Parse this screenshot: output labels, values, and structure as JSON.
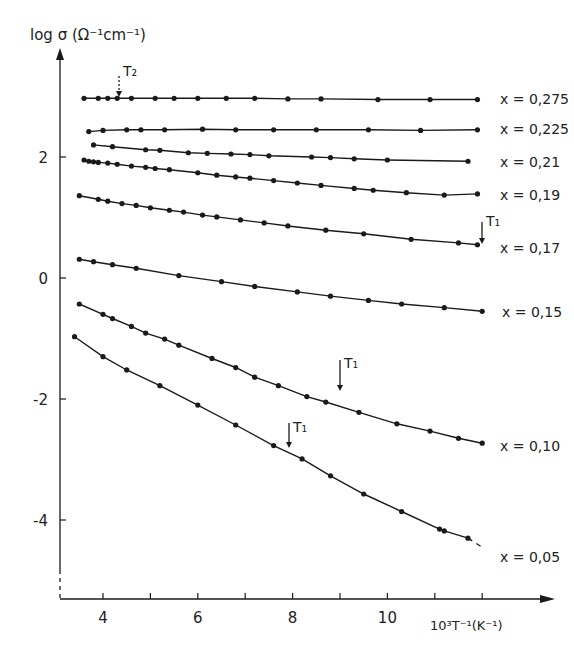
{
  "chart_data": {
    "type": "line",
    "title": "",
    "ylabel": "log σ (Ω⁻¹cm⁻¹)",
    "xlabel": "10³T⁻¹ (K⁻¹)",
    "xlim": [
      3.2,
      13.0
    ],
    "ylim": [
      -5.3,
      3.7
    ],
    "xticks": [
      4,
      5,
      6,
      7,
      8,
      9,
      10,
      11,
      12
    ],
    "xtick_labels": [
      "4",
      "",
      "6",
      "",
      "8",
      "",
      "10",
      "",
      ""
    ],
    "yticks": [
      2,
      0,
      -2,
      -4
    ],
    "ytick_labels": [
      "2",
      "0",
      "-2",
      "-4"
    ],
    "grid": false,
    "legend": "inline labels at right end of each curve",
    "series": [
      {
        "name": "x = 0,275",
        "x": [
          3.6,
          3.9,
          4.1,
          4.3,
          4.6,
          5.1,
          5.5,
          6.0,
          6.6,
          7.2,
          7.9,
          8.6,
          9.8,
          10.9,
          11.9
        ],
        "y": [
          2.97,
          2.97,
          2.97,
          2.97,
          2.97,
          2.97,
          2.97,
          2.97,
          2.97,
          2.97,
          2.96,
          2.96,
          2.95,
          2.95,
          2.95
        ]
      },
      {
        "name": "x = 0,225",
        "x": [
          3.7,
          4.0,
          4.5,
          4.8,
          5.3,
          6.1,
          6.8,
          7.6,
          8.5,
          9.6,
          10.7,
          11.9
        ],
        "y": [
          2.42,
          2.44,
          2.45,
          2.45,
          2.45,
          2.46,
          2.45,
          2.45,
          2.45,
          2.45,
          2.44,
          2.45
        ]
      },
      {
        "name": "x = 0,21",
        "x": [
          3.8,
          4.2,
          4.9,
          5.2,
          5.8,
          6.2,
          6.7,
          7.1,
          7.5,
          8.4,
          8.8,
          9.3,
          10.0,
          11.7
        ],
        "y": [
          2.2,
          2.17,
          2.12,
          2.11,
          2.07,
          2.06,
          2.05,
          2.04,
          2.02,
          2.0,
          1.99,
          1.97,
          1.95,
          1.93
        ]
      },
      {
        "name": "x = 0,19",
        "x": [
          3.6,
          3.7,
          3.8,
          3.9,
          4.1,
          4.3,
          4.6,
          4.9,
          5.1,
          5.4,
          6.0,
          6.4,
          6.8,
          7.1,
          7.6,
          8.1,
          8.6,
          9.3,
          9.7,
          10.4,
          11.2,
          11.9
        ],
        "y": [
          1.95,
          1.93,
          1.92,
          1.91,
          1.9,
          1.88,
          1.85,
          1.83,
          1.81,
          1.79,
          1.74,
          1.7,
          1.67,
          1.65,
          1.61,
          1.57,
          1.53,
          1.48,
          1.45,
          1.41,
          1.37,
          1.39
        ]
      },
      {
        "name": "x = 0,17",
        "x": [
          3.5,
          3.9,
          4.1,
          4.4,
          4.7,
          5.0,
          5.4,
          5.7,
          6.1,
          6.4,
          6.9,
          7.4,
          7.9,
          8.7,
          9.5,
          10.5,
          11.5,
          11.9
        ],
        "y": [
          1.36,
          1.3,
          1.27,
          1.23,
          1.2,
          1.16,
          1.12,
          1.09,
          1.04,
          1.01,
          0.96,
          0.91,
          0.86,
          0.79,
          0.73,
          0.64,
          0.58,
          0.55
        ]
      },
      {
        "name": "x = 0,15",
        "x": [
          3.5,
          3.8,
          4.2,
          4.7,
          5.6,
          6.5,
          7.2,
          8.1,
          8.8,
          9.6,
          10.3,
          11.2,
          12.0
        ],
        "y": [
          0.31,
          0.27,
          0.22,
          0.16,
          0.04,
          -0.06,
          -0.14,
          -0.23,
          -0.3,
          -0.37,
          -0.43,
          -0.49,
          -0.55
        ]
      },
      {
        "name": "x = 0,10",
        "x": [
          3.5,
          4.0,
          4.2,
          4.6,
          4.9,
          5.3,
          5.6,
          6.3,
          6.8,
          7.2,
          7.7,
          8.3,
          8.7,
          9.4,
          10.2,
          10.9,
          11.5,
          12.0
        ],
        "y": [
          -0.43,
          -0.6,
          -0.67,
          -0.8,
          -0.91,
          -1.01,
          -1.11,
          -1.33,
          -1.48,
          -1.64,
          -1.78,
          -1.96,
          -2.05,
          -2.22,
          -2.41,
          -2.53,
          -2.65,
          -2.73
        ]
      },
      {
        "name": "x = 0,05",
        "x": [
          3.4,
          4.0,
          4.5,
          5.2,
          6.0,
          6.8,
          7.6,
          8.2,
          8.8,
          9.5,
          10.3,
          11.1,
          11.2,
          11.7
        ],
        "y": [
          -0.97,
          -1.3,
          -1.52,
          -1.78,
          -2.1,
          -2.43,
          -2.77,
          -2.99,
          -3.27,
          -3.57,
          -3.86,
          -4.15,
          -4.18,
          -4.3
        ]
      }
    ],
    "annotations": [
      {
        "text": "T₂",
        "series": "x = 0,275",
        "x": 4.35,
        "style": "dotted arrow"
      },
      {
        "text": "T₁",
        "series": "x = 0,17",
        "x": 12.0,
        "style": "solid arrow"
      },
      {
        "text": "T₁",
        "series": "x = 0,10",
        "x": 9.0,
        "style": "solid arrow"
      },
      {
        "text": "T₁",
        "series": "x = 0,05",
        "x": 7.9,
        "style": "solid arrow"
      }
    ]
  },
  "labels": {
    "ylabel": "log σ (Ω⁻¹cm⁻¹)",
    "xlabel": "10³T⁻¹(K⁻¹)",
    "series_names": [
      "x = 0,275",
      "x = 0,225",
      "x = 0,21",
      "x = 0,19",
      "x = 0,17",
      "x = 0,15",
      "x = 0,10",
      "x = 0,05"
    ],
    "T1": "T₁",
    "T2": "T₂"
  }
}
